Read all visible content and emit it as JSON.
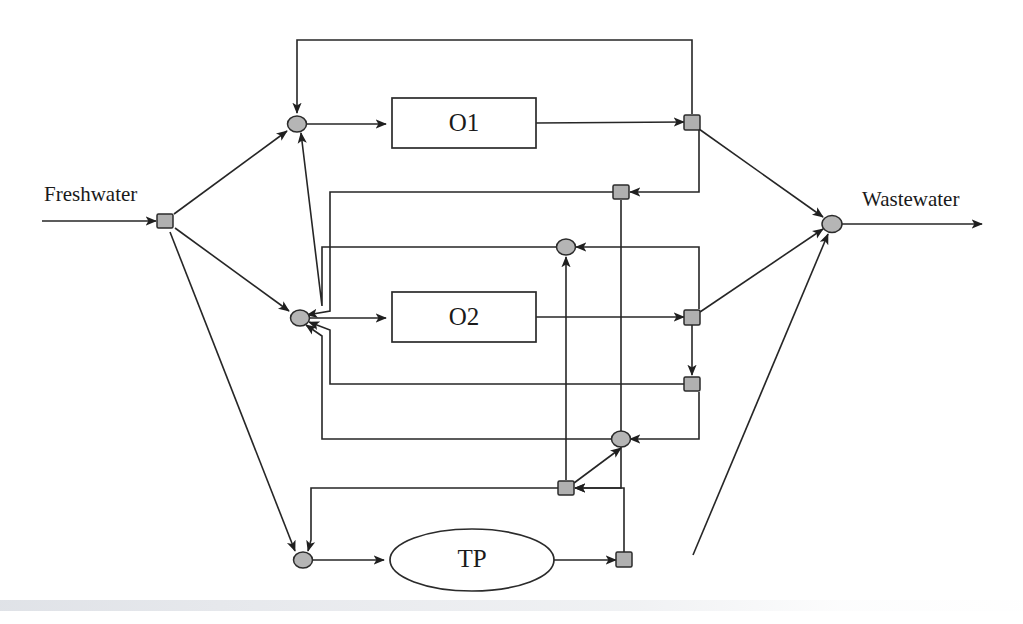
{
  "figure": {
    "type": "process-flow-diagram",
    "width": 1023,
    "height": 624,
    "background_color": "#ffffff",
    "line_color": "#262626",
    "node_fill_color": "#b5b5b5"
  },
  "streams": {
    "inlet_label": "Freshwater",
    "outlet_label": "Wastewater"
  },
  "units": [
    {
      "id": "O1",
      "label": "O1",
      "shape": "rectangle",
      "cx": 464,
      "cy": 123,
      "w": 144,
      "h": 50
    },
    {
      "id": "O2",
      "label": "O2",
      "shape": "rectangle",
      "cx": 464,
      "cy": 317,
      "w": 144,
      "h": 50
    },
    {
      "id": "TP",
      "label": "TP",
      "shape": "ellipse",
      "cx": 472,
      "cy": 560,
      "rx": 82,
      "ry": 31
    }
  ],
  "nodes": [
    {
      "id": "S0",
      "kind": "splitter",
      "name": "freshwater-splitter",
      "x": 165,
      "y": 221
    },
    {
      "id": "M1",
      "kind": "mixer",
      "name": "o1-inlet-mixer",
      "x": 297,
      "y": 124
    },
    {
      "id": "M2",
      "kind": "mixer",
      "name": "o2-inlet-mixer",
      "x": 300,
      "y": 318
    },
    {
      "id": "M3",
      "kind": "mixer",
      "name": "tp-inlet-mixer",
      "x": 303,
      "y": 560
    },
    {
      "id": "S1",
      "kind": "splitter",
      "name": "o1-outlet-splitter",
      "x": 692,
      "y": 122
    },
    {
      "id": "S2",
      "kind": "splitter",
      "name": "o2-outlet-splitter",
      "x": 692,
      "y": 317
    },
    {
      "id": "S3",
      "kind": "splitter",
      "name": "tp-outlet-splitter",
      "x": 624,
      "y": 560
    },
    {
      "id": "S4",
      "kind": "splitter",
      "name": "upper-recycle-splitter",
      "x": 621,
      "y": 192
    },
    {
      "id": "S5",
      "kind": "splitter",
      "name": "lower-recycle-splitter",
      "x": 692,
      "y": 384
    },
    {
      "id": "S6",
      "kind": "splitter",
      "name": "bottom-recycle-splitter",
      "x": 566,
      "y": 488
    },
    {
      "id": "M4",
      "kind": "mixer",
      "name": "upper-reuse-mixer",
      "x": 566,
      "y": 247
    },
    {
      "id": "M5",
      "kind": "mixer",
      "name": "lower-reuse-mixer",
      "x": 621,
      "y": 439
    },
    {
      "id": "MW",
      "kind": "mixer",
      "name": "wastewater-mixer",
      "x": 832,
      "y": 224
    }
  ],
  "edges": [
    {
      "id": "e-fw-in",
      "name": "freshwater-inlet-stream",
      "from": "source",
      "to": "S0"
    },
    {
      "id": "e-s0-m1",
      "name": "freshwater-to-o1-mixer",
      "from": "S0",
      "to": "M1"
    },
    {
      "id": "e-s0-m2",
      "name": "freshwater-to-o2-mixer",
      "from": "S0",
      "to": "M2"
    },
    {
      "id": "e-s0-m3",
      "name": "freshwater-to-tp-mixer",
      "from": "S0",
      "to": "M3"
    },
    {
      "id": "e-m1-o1",
      "name": "o1-feed",
      "from": "M1",
      "to": "O1"
    },
    {
      "id": "e-o1-s1",
      "name": "o1-effluent",
      "from": "O1",
      "to": "S1"
    },
    {
      "id": "e-m2-o2",
      "name": "o2-feed",
      "from": "M2",
      "to": "O2"
    },
    {
      "id": "e-o2-s2",
      "name": "o2-effluent",
      "from": "O2",
      "to": "S2"
    },
    {
      "id": "e-m3-tp",
      "name": "tp-feed",
      "from": "M3",
      "to": "TP"
    },
    {
      "id": "e-tp-s3",
      "name": "tp-effluent",
      "from": "TP",
      "to": "S3"
    },
    {
      "id": "e-s1-mw",
      "name": "o1-to-wastewater",
      "from": "S1",
      "to": "MW"
    },
    {
      "id": "e-s2-mw",
      "name": "o2-to-wastewater",
      "from": "S2",
      "to": "MW"
    },
    {
      "id": "e-s3-mw",
      "name": "tp-to-wastewater",
      "from": "S3",
      "to": "MW"
    },
    {
      "id": "e-s1-m1",
      "name": "o1-self-recycle",
      "from": "S1",
      "to": "M1"
    },
    {
      "id": "e-s1-s4",
      "name": "o1-to-upper-recycle-splitter",
      "from": "S1",
      "to": "S4"
    },
    {
      "id": "e-s4-m2",
      "name": "upper-recycle-to-o2-mixer",
      "from": "S4",
      "to": "M2"
    },
    {
      "id": "e-s4-s6",
      "name": "upper-recycle-to-bottom-splitter",
      "from": "S4",
      "to": "S6"
    },
    {
      "id": "e-s2-m4",
      "name": "o2-reuse-to-upper-mixer",
      "from": "S2",
      "to": "M4"
    },
    {
      "id": "e-m4-m1",
      "name": "upper-reuse-to-o1-mixer",
      "from": "M4",
      "to": "M1"
    },
    {
      "id": "e-s2-s5",
      "name": "o2-to-lower-recycle-splitter",
      "from": "S2",
      "to": "S5"
    },
    {
      "id": "e-s5-m2",
      "name": "lower-recycle-to-o2-mixer",
      "from": "S5",
      "to": "M2"
    },
    {
      "id": "e-s5-m5",
      "name": "lower-recycle-to-lower-mixer",
      "from": "S5",
      "to": "M5"
    },
    {
      "id": "e-m5-m2",
      "name": "lower-reuse-to-o2-mixer",
      "from": "M5",
      "to": "M2"
    },
    {
      "id": "e-s3-s6",
      "name": "tp-recycle-to-bottom-splitter",
      "from": "S3",
      "to": "S6"
    },
    {
      "id": "e-s6-m3",
      "name": "bottom-recycle-to-tp-mixer",
      "from": "S6",
      "to": "M3"
    },
    {
      "id": "e-s6-m4",
      "name": "bottom-recycle-to-upper-mixer",
      "from": "S6",
      "to": "M4"
    },
    {
      "id": "e-s6-m5",
      "name": "bottom-recycle-to-lower-mixer",
      "from": "S6",
      "to": "M5"
    },
    {
      "id": "e-ww-out",
      "name": "wastewater-outlet-stream",
      "from": "MW",
      "to": "sink"
    }
  ]
}
